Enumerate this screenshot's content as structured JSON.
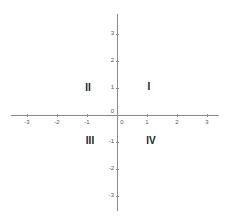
{
  "diagram": {
    "colors": {
      "axis": "#8a8a8a",
      "text": "#222222",
      "tick_label": "#555555",
      "background": "#ffffff"
    },
    "x_axis": {
      "ticks": [
        {
          "value": -3,
          "label": "-3"
        },
        {
          "value": -2,
          "label": "-2"
        },
        {
          "value": -1,
          "label": "-1"
        },
        {
          "value": 0,
          "label": "0"
        },
        {
          "value": 1,
          "label": "1"
        },
        {
          "value": 2,
          "label": "2"
        },
        {
          "value": 3,
          "label": "3"
        }
      ]
    },
    "y_axis": {
      "ticks": [
        {
          "value": 3,
          "label": "3"
        },
        {
          "value": 2,
          "label": "2"
        },
        {
          "value": 1,
          "label": "1"
        },
        {
          "value": 0,
          "label": "0"
        },
        {
          "value": -1,
          "label": "-1"
        },
        {
          "value": -2,
          "label": "-2"
        },
        {
          "value": -3,
          "label": "-3"
        }
      ]
    },
    "quadrants": {
      "I": "I",
      "II": "II",
      "III": "III",
      "IV": "IV"
    }
  }
}
